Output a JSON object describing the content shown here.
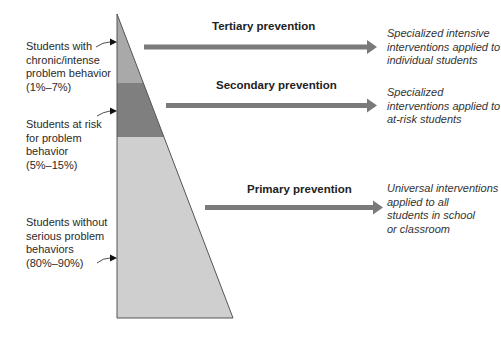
{
  "colors": {
    "tertiary_band": "#a9a9a9",
    "secondary_band": "#7f7f7f",
    "primary_band": "#cfcfcf",
    "arrow": "#7a7a7a",
    "outline": "#555555"
  },
  "groups": [
    {
      "label": "Students with chronic/intense problem behavior",
      "lines": [
        "Students with",
        "chronic/intense",
        "problem behavior",
        "(1%–7%)"
      ],
      "range": "(1%–7%)"
    },
    {
      "label": "Students at risk for problem behavior",
      "lines": [
        "Students at risk",
        "for problem",
        "behavior",
        "(5%–15%)"
      ],
      "range": "(5%–15%)"
    },
    {
      "label": "Students without serious problem behaviors",
      "lines": [
        "Students without",
        "serious problem",
        "behaviors",
        "(80%–90%)"
      ],
      "range": "(80%–90%)"
    }
  ],
  "tiers": [
    {
      "name": "Tertiary prevention",
      "lines": [
        "Specialized intensive",
        "interventions applied to",
        "individual students"
      ]
    },
    {
      "name": "Secondary prevention",
      "lines": [
        "Specialized",
        "interventions applied to",
        "at-risk students"
      ]
    },
    {
      "name": "Primary prevention",
      "lines": [
        "Universal interventions",
        "applied to all",
        "students in school",
        "or classroom"
      ]
    }
  ]
}
